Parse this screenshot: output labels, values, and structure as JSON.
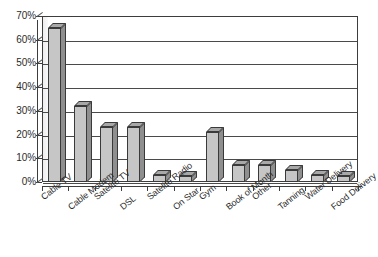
{
  "chart_data": {
    "type": "bar",
    "title": "",
    "subtitle": "",
    "xlabel": "",
    "ylabel": "",
    "ylim": [
      0,
      70
    ],
    "grid": true,
    "legend": "none",
    "style": "3d-grayscale-column",
    "categories": [
      "Cable TV",
      "Cable Modem",
      "Satelite TV",
      "DSL",
      "Satelite Radio",
      "On Star",
      "Gym",
      "Book of Month",
      "Other",
      "Tanning",
      "Water Delivery",
      "Food Delivery"
    ],
    "values": [
      65,
      32,
      23,
      23,
      3,
      2.5,
      21,
      7,
      7,
      5,
      3,
      2.5
    ],
    "value_labels": [
      "65%",
      "32%",
      "23%",
      "23%",
      "3%",
      "2.5%",
      "21%",
      "7%",
      "7%",
      "5%",
      "3%",
      "2.5%"
    ],
    "ytick_labels": [
      "70%",
      "60%",
      "50%",
      "40%",
      "30%",
      "20%",
      "10%",
      "0%"
    ],
    "ytick_values": [
      70,
      60,
      50,
      40,
      30,
      20,
      10,
      0
    ],
    "colors": {
      "bar_front": "#c6c6c6",
      "bar_side": "#8f8f8f",
      "bar_top": "#a8a8a8",
      "outline": "#3a3a3a",
      "gridline": "#4a4a4a",
      "axis": "#3d3d3d",
      "text": "#2b2b2b",
      "background": "#ffffff"
    }
  }
}
